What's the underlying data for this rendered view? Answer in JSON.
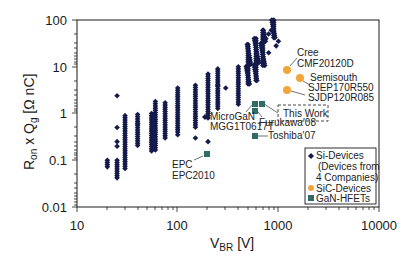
{
  "chart_data": {
    "type": "scatter",
    "title": "",
    "xlabel": "V_BR [V]",
    "ylabel": "R_on x Q_g [Ω nC]",
    "xscale": "log",
    "yscale": "log",
    "xlim": [
      10,
      10000
    ],
    "ylim": [
      0.01,
      100
    ],
    "x_ticks": [
      "10",
      "100",
      "1000",
      "10000"
    ],
    "y_ticks": [
      "100",
      "10",
      "1",
      "0.1",
      "0.01"
    ],
    "grid": false,
    "legend_position": "lower right inside",
    "legend": [
      {
        "label": "Si-Devices",
        "sublabel": [
          "(Devices from",
          "4 Companies)"
        ],
        "marker": "diamond",
        "color": "#141a4a"
      },
      {
        "label": "SiC-Devices",
        "marker": "circle",
        "color": "#f4a53a"
      },
      {
        "label": "GaN-HFETs",
        "marker": "square",
        "color": "#2f6b68"
      }
    ],
    "series": [
      {
        "name": "Si-Devices",
        "marker": "diamond",
        "color": "#141a4a",
        "clusters": [
          {
            "x": 20,
            "y_min": 0.07,
            "y_max": 0.1
          },
          {
            "x": 25,
            "y_min": 0.04,
            "y_max": 0.1,
            "outliers": [
              2.4,
              0.5,
              0.25,
              0.2
            ]
          },
          {
            "x": 30,
            "y_min": 0.06,
            "y_max": 0.9
          },
          {
            "x": 40,
            "y_min": 0.2,
            "y_max": 0.95
          },
          {
            "x": 55,
            "y_min": 0.15,
            "y_max": 1.0
          },
          {
            "x": 60,
            "y_min": 0.16,
            "y_max": 1.8
          },
          {
            "x": 75,
            "y_min": 0.3,
            "y_max": 1.7
          },
          {
            "x": 100,
            "y_min": 0.4,
            "y_max": 3.5
          },
          {
            "x": 150,
            "y_min": 0.5,
            "y_max": 4
          },
          {
            "x": 200,
            "y_min": 0.8,
            "y_max": 7
          },
          {
            "x": 250,
            "y_min": 1.2,
            "y_max": 9
          },
          {
            "x": 400,
            "y_min": 1.5,
            "y_max": 10
          },
          {
            "x": 500,
            "y_min": 4,
            "y_max": 30
          },
          {
            "x": 600,
            "y_min": 5,
            "y_max": 40
          },
          {
            "x": 700,
            "y_min": 10,
            "y_max": 60
          },
          {
            "x": 900,
            "y_min": 40,
            "y_max": 100
          }
        ]
      },
      {
        "name": "SiC-Devices",
        "marker": "circle",
        "color": "#f4a53a",
        "points": [
          {
            "x": 1200,
            "y": 8.5,
            "label": "Cree CMF20120D"
          },
          {
            "x": 1650,
            "y": 5.5,
            "label": "Semisouth SJEP170R550"
          },
          {
            "x": 1200,
            "y": 3.1,
            "label": "SJDP120R085"
          }
        ]
      },
      {
        "name": "GaN-HFETs",
        "marker": "square",
        "color": "#2f6b68",
        "points": [
          {
            "x": 590,
            "y": 1.6,
            "label": "MicroGaN MGG1T0617T"
          },
          {
            "x": 670,
            "y": 1.6,
            "label": "This Work"
          },
          {
            "x": 590,
            "y": 1.1,
            "label": "Furukawa'08"
          },
          {
            "x": 590,
            "y": 0.33,
            "label": "Toshiba'07"
          },
          {
            "x": 200,
            "y": 0.13,
            "label": "EPC EPC2010"
          }
        ]
      }
    ],
    "annotations": [
      {
        "lines": [
          "Cree",
          "CMF20120D"
        ]
      },
      {
        "lines": [
          "Semisouth",
          "SJEP170R550"
        ]
      },
      {
        "lines": [
          "SJDP120R085"
        ]
      },
      {
        "lines": [
          "This Work"
        ],
        "boxed": "dashed"
      },
      {
        "lines": [
          "MicroGaN",
          "MGG1T0617T"
        ]
      },
      {
        "lines": [
          "Furukawa'08"
        ]
      },
      {
        "lines": [
          "Toshiba'07"
        ]
      },
      {
        "lines": [
          "EPC",
          "EPC2010"
        ]
      }
    ]
  },
  "labels": {
    "x_axis_main": "V",
    "x_axis_sub": "BR",
    "x_axis_unit": " [V]",
    "y_axis_r": "R",
    "y_axis_on": "on",
    "y_axis_mid": " x Q",
    "y_axis_g": "g",
    "y_axis_unit": " [Ω nC]",
    "xt10": "10",
    "xt100": "100",
    "xt1000": "1000",
    "xt10000": "10000",
    "yt100": "100",
    "yt10": "10",
    "yt1": "1",
    "yt01": "0.1",
    "yt001": "0.01",
    "cree": "Cree",
    "cree_part": "CMF20120D",
    "semi": "Semisouth",
    "semi_part": "SJEP170R550",
    "sjdp": "SJDP120R085",
    "thiswork": "This Work",
    "microgan": "MicroGaN",
    "microgan_part": "MGG1T0617T",
    "furukawa": "Furukawa'08",
    "toshiba": "Toshiba'07",
    "epc": "EPC",
    "epc_part": "EPC2010",
    "leg_si": "Si-Devices",
    "leg_si2": "(Devices from",
    "leg_si3": "4 Companies)",
    "leg_sic": "SiC-Devices",
    "leg_gan": "GaN-HFETs"
  }
}
